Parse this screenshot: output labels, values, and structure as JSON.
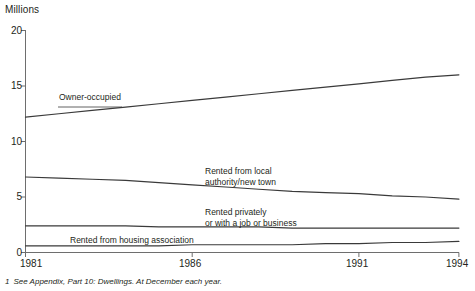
{
  "chart_data": {
    "type": "line",
    "title": "",
    "subtitle": "",
    "xlabel": "",
    "ylabel": "Millions",
    "x": [
      1981,
      1982,
      1983,
      1984,
      1985,
      1986,
      1987,
      1988,
      1989,
      1990,
      1991,
      1992,
      1993,
      1994
    ],
    "xlim": [
      1981,
      1994
    ],
    "ylim": [
      0,
      20
    ],
    "grid": false,
    "legend_position": "inline-annotations",
    "xticks": [
      "1981",
      "1986",
      "1991",
      "1994"
    ],
    "xtick_values": [
      1981,
      1986,
      1991,
      1994
    ],
    "yticks": [
      "0",
      "5",
      "10",
      "15",
      "20"
    ],
    "ytick_values": [
      0,
      5,
      10,
      15,
      20
    ],
    "series": [
      {
        "name": "Owner-occupied",
        "label": "Owner-occupied",
        "values": [
          12.2,
          12.5,
          12.8,
          13.1,
          13.4,
          13.7,
          14.0,
          14.3,
          14.6,
          14.9,
          15.2,
          15.5,
          15.8,
          16.0
        ]
      },
      {
        "name": "Rented from local authority/new town",
        "label": "Rented from local\nauthority/new town",
        "label_line1": "Rented from local",
        "label_line2": "authority/new town",
        "values": [
          6.8,
          6.7,
          6.6,
          6.5,
          6.3,
          6.1,
          5.9,
          5.7,
          5.5,
          5.4,
          5.3,
          5.1,
          5.0,
          4.8
        ]
      },
      {
        "name": "Rented privately or with a job or business",
        "label": "Rented privately\nor with a job or business",
        "label_line1": "Rented privately",
        "label_line2": "or with a job or business",
        "values": [
          2.4,
          2.4,
          2.4,
          2.4,
          2.3,
          2.3,
          2.3,
          2.3,
          2.2,
          2.2,
          2.2,
          2.2,
          2.2,
          2.2
        ]
      },
      {
        "name": "Rented from housing association",
        "label": "Rented from housing association",
        "values": [
          0.6,
          0.6,
          0.6,
          0.6,
          0.6,
          0.7,
          0.7,
          0.7,
          0.7,
          0.8,
          0.8,
          0.9,
          0.9,
          1.0
        ]
      }
    ],
    "annotations": [
      {
        "text": "Owner-occupied",
        "series": "Owner-occupied"
      },
      {
        "text": "Rented from local authority/new town",
        "series": "Rented from local authority/new town"
      },
      {
        "text": "Rented privately or with a job or business",
        "series": "Rented privately or with a job or business"
      },
      {
        "text": "Rented from housing association",
        "series": "Rented from housing association"
      }
    ],
    "line_color": "#3a3a3a",
    "axis_color": "#6e6e6e",
    "background": "#ffffff"
  },
  "footnote": {
    "number": "1",
    "text": "See Appendix, Part 10: Dwellings. At December each year."
  }
}
